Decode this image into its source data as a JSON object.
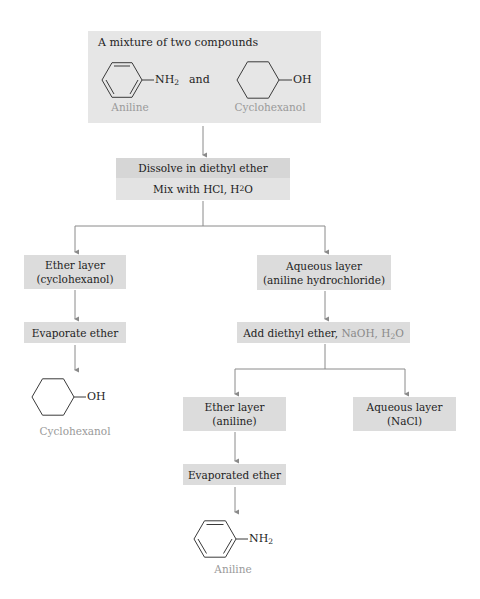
{
  "start_box": {
    "title": "A mixture of two compounds",
    "compound_a": {
      "substituent": "NH",
      "sub": "2",
      "label": "Aniline"
    },
    "connector": "and",
    "compound_b": {
      "substituent": "OH",
      "label": "Cyclohexanol"
    }
  },
  "step1": {
    "line1": "Dissolve in diethyl ether",
    "line2_prefix": "Mix with HCl, H",
    "line2_sub": "2",
    "line2_suffix": "O"
  },
  "left_branch": {
    "layer_line1": "Ether layer",
    "layer_line2": "(cyclohexanol)",
    "step": "Evaporate ether",
    "product": {
      "substituent": "OH",
      "label": "Cyclohexanol"
    }
  },
  "right_branch": {
    "layer_line1": "Aqueous layer",
    "layer_line2": "(aniline hydrochloride)",
    "step_prefix": "Add diethyl ether, ",
    "step_reagents_prefix": "NaOH, H",
    "step_reagents_sub": "2",
    "step_reagents_suffix": "O",
    "sub_left": {
      "layer_line1": "Ether layer",
      "layer_line2": "(aniline)",
      "step": "Evaporated ether",
      "product": {
        "substituent": "NH",
        "sub": "2",
        "label": "Aniline"
      }
    },
    "sub_right": {
      "layer_line1": "Aqueous layer",
      "layer_line2": "(NaCl)"
    }
  },
  "colors": {
    "box_fill": "#dcdcdc",
    "start_box_fill": "#e6e6e6",
    "arrow": "#8a8a8a",
    "label_gray": "#9a9a9a"
  }
}
